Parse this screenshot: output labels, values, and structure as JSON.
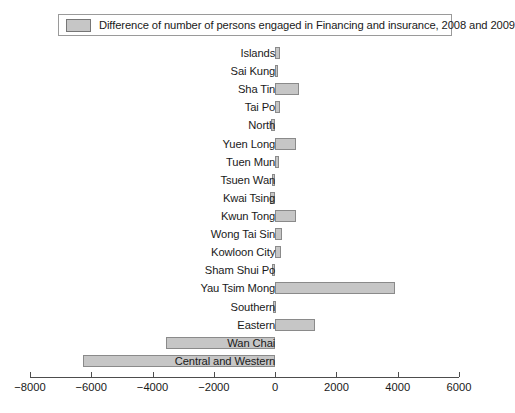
{
  "legend": {
    "swatch_color": "#c6c6c6",
    "label": "Difference of number of persons engaged in Financing and insurance, 2008 and 2009"
  },
  "chart_data": {
    "type": "bar",
    "orientation": "horizontal",
    "title": "",
    "xlabel": "",
    "ylabel": "",
    "xlim": [
      -8000,
      6000
    ],
    "xticks": [
      -8000,
      -6000,
      -4000,
      -2000,
      0,
      2000,
      4000,
      6000
    ],
    "xtick_labels": [
      "−8000",
      "−6000",
      "−4000",
      "−2000",
      "0",
      "2000",
      "4000",
      "6000"
    ],
    "grid": false,
    "legend_position": "top",
    "series_name": "Difference of number of persons engaged in Financing and insurance, 2008 and 2009",
    "bar_color": "#c6c6c6",
    "bar_edge_color": "#8a8a8a",
    "categories": [
      "Islands",
      "Sai Kung",
      "Sha Tin",
      "Tai Po",
      "North",
      "Yuen Long",
      "Tuen Mun",
      "Tsuen Wan",
      "Kwai Tsing",
      "Kwun Tong",
      "Wong Tai Sin",
      "Kowloon City",
      "Sham Shui Po",
      "Yau Tsim Mong",
      "Southern",
      "Eastern",
      "Wan Chai",
      "Central and Western"
    ],
    "values": [
      160,
      40,
      780,
      170,
      -120,
      690,
      130,
      -110,
      -160,
      680,
      210,
      200,
      -100,
      3900,
      -60,
      1300,
      -3570,
      -6270
    ]
  }
}
